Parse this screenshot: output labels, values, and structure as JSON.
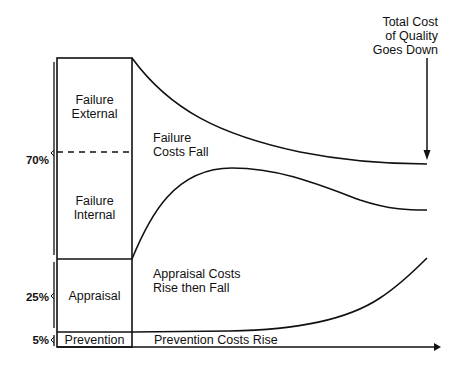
{
  "diagram": {
    "title_annotation": [
      "Total Cost",
      "of Quality",
      "Goes Down"
    ],
    "box_segments": [
      {
        "label": [
          "Failure",
          "External"
        ]
      },
      {
        "label": [
          "Failure",
          "Internal"
        ]
      },
      {
        "label": [
          "Appraisal"
        ]
      },
      {
        "label": [
          "Prevention"
        ]
      }
    ],
    "percent_labels": {
      "p70": "70%",
      "p25": "25%",
      "p5": "5%"
    },
    "region_labels": {
      "failure": [
        "Failure",
        "Costs Fall"
      ],
      "appraisal": [
        "Appraisal Costs",
        "Rise then Fall"
      ],
      "prevention": "Prevention Costs Rise"
    },
    "line_color": "#111111",
    "background": "#ffffff"
  }
}
